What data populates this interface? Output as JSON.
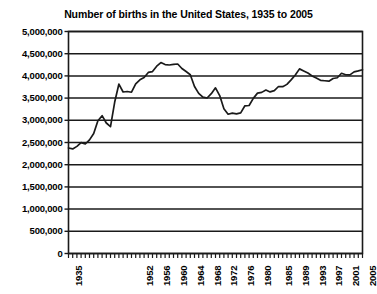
{
  "chart_data": {
    "type": "line",
    "title": "Number of births in the United States, 1935 to 2005",
    "xlabel": "",
    "ylabel": "",
    "xlim": [
      1935,
      2005
    ],
    "ylim": [
      0,
      5000000
    ],
    "grid": true,
    "legend": "none",
    "y_ticks": [
      "5,000,000",
      "4,500,000",
      "4,000,000",
      "3,500,000",
      "3,000,000",
      "2,500,000",
      "2,000,000",
      "1,500,000",
      "1,000,000",
      "500,000",
      "0"
    ],
    "y_tick_values": [
      5000000,
      4500000,
      4000000,
      3500000,
      3000000,
      2500000,
      2000000,
      1500000,
      1000000,
      500000,
      0
    ],
    "x_ticks": [
      "1935",
      "1952",
      "1956",
      "1960",
      "1964",
      "1968",
      "1972",
      "1976",
      "1980",
      "1985",
      "1989",
      "1993",
      "1997",
      "2001",
      "2005"
    ],
    "x_tick_values": [
      1935,
      1952,
      1956,
      1960,
      1964,
      1968,
      1972,
      1976,
      1980,
      1985,
      1989,
      1993,
      1997,
      2001,
      2005
    ],
    "series": [
      {
        "name": "Births",
        "color": "#1a1a1a",
        "x": [
          1935,
          1936,
          1937,
          1938,
          1939,
          1940,
          1941,
          1942,
          1943,
          1944,
          1945,
          1946,
          1947,
          1948,
          1949,
          1950,
          1951,
          1952,
          1953,
          1954,
          1955,
          1956,
          1957,
          1958,
          1959,
          1960,
          1961,
          1962,
          1963,
          1964,
          1965,
          1966,
          1967,
          1968,
          1969,
          1970,
          1971,
          1972,
          1973,
          1974,
          1975,
          1976,
          1977,
          1978,
          1979,
          1980,
          1981,
          1982,
          1983,
          1984,
          1985,
          1986,
          1987,
          1988,
          1989,
          1990,
          1991,
          1992,
          1993,
          1994,
          1995,
          1996,
          1997,
          1998,
          1999,
          2000,
          2001,
          2002,
          2003,
          2004,
          2005
        ],
        "values": [
          2377000,
          2355000,
          2413000,
          2496000,
          2466000,
          2559000,
          2703000,
          2989000,
          3104000,
          2939000,
          2858000,
          3411000,
          3817000,
          3637000,
          3649000,
          3632000,
          3823000,
          3913000,
          3965000,
          4078000,
          4097000,
          4218000,
          4300000,
          4255000,
          4245000,
          4258000,
          4268000,
          4167000,
          4098000,
          4027000,
          3760000,
          3606000,
          3521000,
          3502000,
          3600000,
          3731000,
          3556000,
          3258000,
          3137000,
          3160000,
          3144000,
          3168000,
          3327000,
          3333000,
          3494000,
          3612000,
          3629000,
          3681000,
          3639000,
          3669000,
          3761000,
          3757000,
          3809000,
          3910000,
          4021000,
          4158000,
          4111000,
          4065000,
          4000000,
          3953000,
          3900000,
          3891000,
          3881000,
          3942000,
          3959000,
          4059000,
          4026000,
          4022000,
          4090000,
          4112000,
          4138000
        ]
      }
    ]
  }
}
